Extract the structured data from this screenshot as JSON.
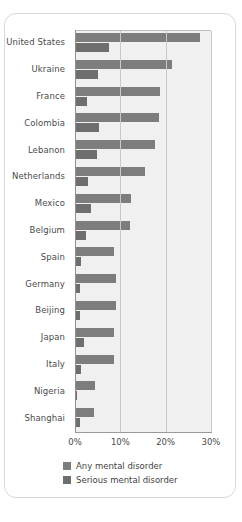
{
  "chart_data": {
    "type": "bar",
    "orientation": "horizontal",
    "title": "",
    "xlabel": "",
    "ylabel": "",
    "xlim": [
      0,
      30
    ],
    "xticks": [
      "0%",
      "10%",
      "20%",
      "30%"
    ],
    "xtick_values": [
      0,
      10,
      20,
      30
    ],
    "grid": true,
    "legend_position": "bottom",
    "categories": [
      "United States",
      "Ukraine",
      "France",
      "Colombia",
      "Lebanon",
      "Netherlands",
      "Mexico",
      "Belgium",
      "Spain",
      "Germany",
      "Beijing",
      "Japan",
      "Italy",
      "Nigeria",
      "Shanghai"
    ],
    "series": [
      {
        "name": "Any mental disorder",
        "color": "#7d7d7d",
        "values": [
          27.5,
          21.3,
          18.7,
          18.5,
          17.6,
          15.4,
          12.4,
          12.2,
          8.7,
          9.1,
          9.1,
          8.7,
          8.5,
          4.4,
          4.3
        ]
      },
      {
        "name": "Serious mental disorder",
        "color": "#6e6e6e",
        "values": [
          7.5,
          5.1,
          2.7,
          5.4,
          4.9,
          2.9,
          3.6,
          2.4,
          1.3,
          1.2,
          1.0,
          2.0,
          1.4,
          0.4,
          1.1
        ]
      }
    ]
  }
}
